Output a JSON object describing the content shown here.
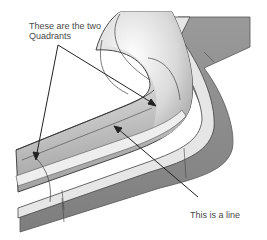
{
  "diagram": {
    "annotations": {
      "quadrants_label_line1": "These are the two",
      "quadrants_label_line2": "Quadrants",
      "line_label": "This is a line"
    },
    "colors": {
      "background": "#ffffff",
      "pipe_light": "#f2f2f2",
      "pipe_mid": "#c8c8c8",
      "pipe_dark": "#9a9a9a",
      "wall_side": "#8c8c8c",
      "wall_top": "#e0e0e0",
      "edge": "#333333",
      "arrow": "#222222",
      "text": "#4a4a4a"
    }
  }
}
